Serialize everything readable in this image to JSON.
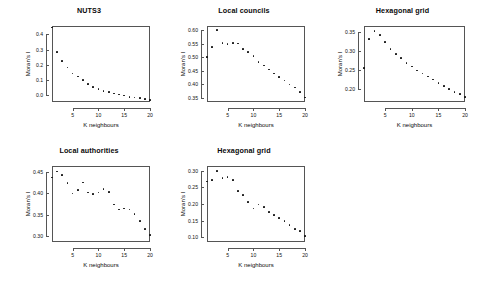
{
  "figure": {
    "background": "#ffffff",
    "point_color": "#111111",
    "axis_color": "#555555",
    "layout": "2 rows; top row 3 panels, bottom row 2 panels"
  },
  "chart_data": [
    {
      "type": "scatter",
      "title": "NUTS3",
      "xlabel": "K neighbours",
      "ylabel": "Moran's I",
      "xlim": [
        1,
        20
      ],
      "ylim": [
        -0.045,
        0.455
      ],
      "xticks": [
        5,
        10,
        15,
        20
      ],
      "yticks": [
        0.0,
        0.1,
        0.2,
        0.3,
        0.4
      ],
      "ytick_labels": [
        "0.0",
        "0.1",
        "0.2",
        "0.3",
        "0.4"
      ],
      "grid": false,
      "legend": "none",
      "x": [
        1,
        2,
        3,
        4,
        5,
        6,
        7,
        8,
        9,
        10,
        11,
        12,
        13,
        14,
        15,
        16,
        17,
        18,
        19,
        20
      ],
      "values": [
        0.445,
        0.283,
        0.225,
        0.182,
        0.143,
        0.122,
        0.098,
        0.075,
        0.055,
        0.04,
        0.028,
        0.019,
        0.01,
        0.004,
        -0.003,
        -0.01,
        -0.015,
        -0.02,
        -0.024,
        -0.03
      ]
    },
    {
      "type": "scatter",
      "title": "Local councils",
      "xlabel": "K neighbours",
      "ylabel": "Moran's I",
      "xlim": [
        1,
        20
      ],
      "ylim": [
        0.335,
        0.615
      ],
      "xticks": [
        5,
        10,
        15,
        20
      ],
      "yticks": [
        0.35,
        0.4,
        0.45,
        0.5,
        0.55,
        0.6
      ],
      "ytick_labels": [
        "0.35",
        "0.40",
        "0.45",
        "0.50",
        "0.55",
        "0.60"
      ],
      "grid": false,
      "legend": "none",
      "x": [
        1,
        2,
        3,
        4,
        5,
        6,
        7,
        8,
        9,
        10,
        11,
        12,
        13,
        14,
        15,
        16,
        17,
        18,
        19,
        20
      ],
      "values": [
        0.5,
        0.537,
        0.6,
        0.553,
        0.548,
        0.553,
        0.55,
        0.53,
        0.52,
        0.505,
        0.482,
        0.47,
        0.455,
        0.44,
        0.428,
        0.414,
        0.4,
        0.388,
        0.372,
        0.352
      ]
    },
    {
      "type": "scatter",
      "title": "Hexagonal grid",
      "xlabel": "K neighbours",
      "ylabel": "Moran's I",
      "xlim": [
        1,
        20
      ],
      "ylim": [
        0.165,
        0.365
      ],
      "xticks": [
        5,
        10,
        15,
        20
      ],
      "yticks": [
        0.2,
        0.25,
        0.3,
        0.35
      ],
      "ytick_labels": [
        "0.20",
        "0.25",
        "0.30",
        "0.35"
      ],
      "grid": false,
      "legend": "none",
      "x": [
        1,
        2,
        3,
        4,
        5,
        6,
        7,
        8,
        9,
        10,
        11,
        12,
        13,
        14,
        15,
        16,
        17,
        18,
        19,
        20
      ],
      "values": [
        0.255,
        0.33,
        0.352,
        0.342,
        0.322,
        0.305,
        0.292,
        0.28,
        0.268,
        0.258,
        0.248,
        0.24,
        0.232,
        0.224,
        0.215,
        0.207,
        0.199,
        0.192,
        0.186,
        0.178
      ]
    },
    {
      "type": "scatter",
      "title": "Local authorities",
      "xlabel": "K neighbours",
      "ylabel": "Moran's I",
      "xlim": [
        1,
        20
      ],
      "ylim": [
        0.285,
        0.465
      ],
      "xticks": [
        5,
        10,
        15,
        20
      ],
      "yticks": [
        0.3,
        0.35,
        0.4,
        0.45
      ],
      "ytick_labels": [
        "0.30",
        "0.35",
        "0.40",
        "0.45"
      ],
      "grid": false,
      "legend": "none",
      "x": [
        1,
        2,
        3,
        4,
        5,
        6,
        7,
        8,
        9,
        10,
        11,
        12,
        13,
        14,
        15,
        16,
        17,
        18,
        19,
        20
      ],
      "values": [
        0.438,
        0.452,
        0.444,
        0.424,
        0.4,
        0.408,
        0.426,
        0.402,
        0.398,
        0.402,
        0.41,
        0.404,
        0.374,
        0.362,
        0.364,
        0.362,
        0.352,
        0.334,
        0.316,
        0.302
      ]
    },
    {
      "type": "scatter",
      "title": "Hexagonal grid",
      "xlabel": "K neighbours",
      "ylabel": "Moran's I",
      "xlim": [
        1,
        20
      ],
      "ylim": [
        0.085,
        0.315
      ],
      "xticks": [
        5,
        10,
        15,
        20
      ],
      "yticks": [
        0.1,
        0.15,
        0.2,
        0.25,
        0.3
      ],
      "ytick_labels": [
        "0.10",
        "0.15",
        "0.20",
        "0.25",
        "0.30"
      ],
      "grid": false,
      "legend": "none",
      "x": [
        1,
        2,
        3,
        4,
        5,
        6,
        7,
        8,
        9,
        10,
        11,
        12,
        13,
        14,
        15,
        16,
        17,
        18,
        19,
        20
      ],
      "values": [
        0.268,
        0.272,
        0.3,
        0.278,
        0.282,
        0.272,
        0.24,
        0.228,
        0.205,
        0.186,
        0.198,
        0.19,
        0.176,
        0.166,
        0.158,
        0.148,
        0.136,
        0.124,
        0.118,
        0.104
      ]
    }
  ]
}
